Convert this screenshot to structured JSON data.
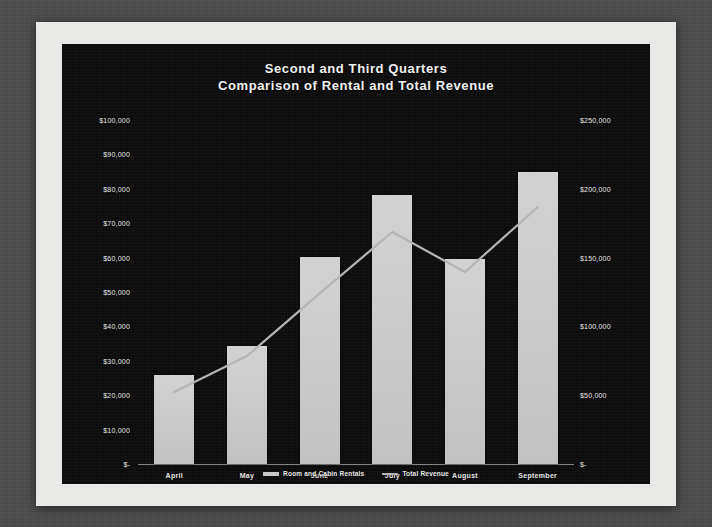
{
  "chart_data": {
    "type": "bar",
    "title": "Second and Third Quarters",
    "subtitle": "Comparison of Rental and Total Revenue",
    "categories": [
      "April",
      "May",
      "June",
      "July",
      "August",
      "September"
    ],
    "xlabel": "",
    "ylabel": "",
    "grid": false,
    "legend_position": "bottom",
    "series": [
      {
        "name": "Room and Cabin Rentals",
        "type": "bar",
        "axis": "left",
        "values": [
          26000,
          34300,
          60200,
          78200,
          59600,
          85000
        ]
      },
      {
        "name": "Total Revenue",
        "type": "line",
        "axis": "right",
        "values": [
          52300,
          78500,
          124000,
          168600,
          139500,
          186700
        ]
      }
    ],
    "left_axis": {
      "min": 0,
      "max": 100000,
      "step": 10000,
      "ticks": [
        "$-",
        "$10,000",
        "$20,000",
        "$30,000",
        "$40,000",
        "$50,000",
        "$60,000",
        "$70,000",
        "$80,000",
        "$90,000",
        "$100,000"
      ]
    },
    "right_axis": {
      "min": 0,
      "max": 250000,
      "step": 50000,
      "ticks": [
        "$-",
        "$50,000",
        "$100,000",
        "$150,000",
        "$200,000",
        "$250,000"
      ]
    },
    "colors": {
      "plot_background": "#0d0d0d",
      "bar_fill": "#c9c9c9",
      "line_stroke": "#b4b4b4",
      "text": "#ededed",
      "paper": "#e9e9e7"
    }
  }
}
